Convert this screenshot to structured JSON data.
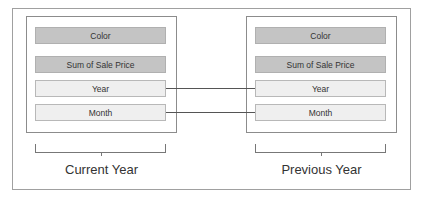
{
  "diagram": {
    "type": "pivot-field-comparison",
    "panels": [
      {
        "id": "current",
        "label": "Current Year",
        "fields": [
          {
            "name": "Color",
            "style": "dark"
          },
          {
            "name": "Sum of Sale Price",
            "style": "dark"
          },
          {
            "name": "Year",
            "style": "light"
          },
          {
            "name": "Month",
            "style": "light"
          }
        ]
      },
      {
        "id": "previous",
        "label": "Previous Year",
        "fields": [
          {
            "name": "Color",
            "style": "dark"
          },
          {
            "name": "Sum of Sale Price",
            "style": "dark"
          },
          {
            "name": "Year",
            "style": "light"
          },
          {
            "name": "Month",
            "style": "light"
          }
        ]
      }
    ],
    "connections": [
      {
        "from": "current.Year",
        "to": "previous.Year"
      },
      {
        "from": "current.Month",
        "to": "previous.Month"
      }
    ],
    "colors": {
      "dark_field": "#c4c4c4",
      "light_field": "#efefef",
      "border": "#8c8c8c",
      "connector": "#555555"
    }
  }
}
